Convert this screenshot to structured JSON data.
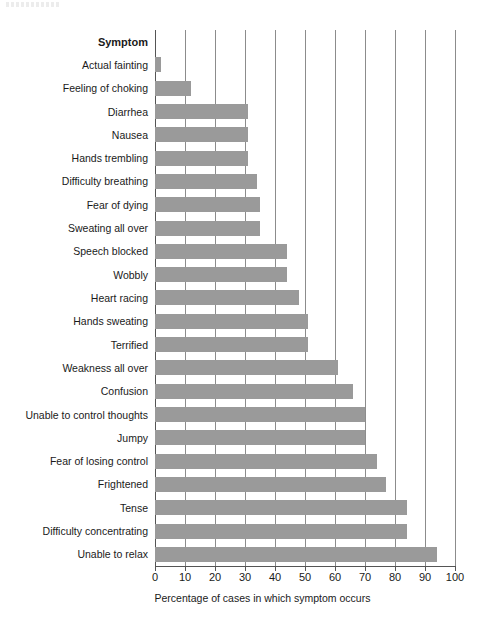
{
  "chart_data": {
    "type": "bar",
    "orientation": "horizontal",
    "title": "",
    "xlabel": "Percentage of cases in which symptom occurs",
    "ylabel": "Symptom",
    "xlim": [
      0,
      100
    ],
    "xticks": [
      0,
      10,
      20,
      30,
      40,
      50,
      60,
      70,
      80,
      90,
      100
    ],
    "xtick_labels": [
      "0",
      "10",
      "20",
      "30",
      "40",
      "50",
      "60",
      "70",
      "80",
      "90",
      "100"
    ],
    "grid": "vertical",
    "legend": "none",
    "bar_color": "#9a9a9a",
    "axis_color": "#555555",
    "gridline_color": "#8c8c8c",
    "categories": [
      "Actual fainting",
      "Feeling of choking",
      "Diarrhea",
      "Nausea",
      "Hands trembling",
      "Difficulty breathing",
      "Fear of dying",
      "Sweating all over",
      "Speech blocked",
      "Wobbly",
      "Heart racing",
      "Hands sweating",
      "Terrified",
      "Weakness all over",
      "Confusion",
      "Unable to control thoughts",
      "Jumpy",
      "Fear of losing control",
      "Frightened",
      "Tense",
      "Difficulty concentrating",
      "Unable to relax"
    ],
    "values": [
      2,
      12,
      31,
      31,
      31,
      34,
      35,
      35,
      44,
      44,
      48,
      51,
      51,
      61,
      66,
      70,
      70,
      74,
      77,
      84,
      84,
      94
    ]
  },
  "axis": {
    "category_header": "Symptom"
  }
}
